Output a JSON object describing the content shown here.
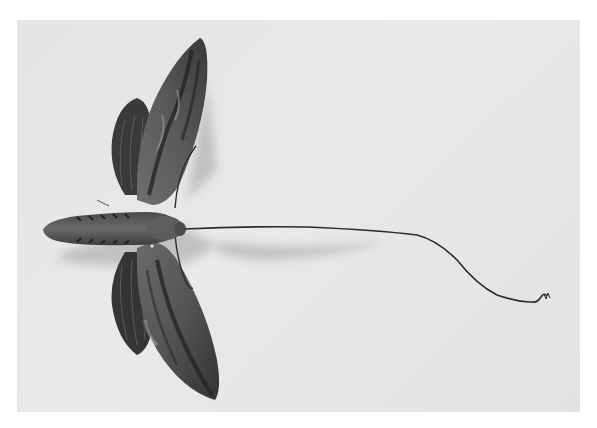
{
  "image": {
    "subject": "hawk moth specimen with extended long proboscis",
    "background_color": "#e6e6e6",
    "page_color": "#ffffff",
    "colors": {
      "wing_dark": "#2a2a2a",
      "wing_mid": "#5a5a5a",
      "wing_light": "#8a8a8a",
      "body": "#555555",
      "shadow": "#b8b8b8",
      "proboscis": "#2b2b2b"
    }
  }
}
